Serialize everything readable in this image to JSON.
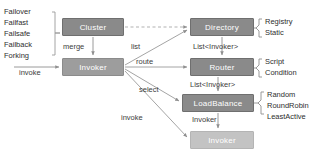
{
  "diagram": {
    "colors": {
      "node_dark": "#8a8a8a",
      "node_mid": "#9d9d9d",
      "node_light": "#c3c3c3",
      "wire": "#9a9a9a",
      "text": "#2e2e2e"
    },
    "nodes": [
      {
        "id": "cluster",
        "label": "Cluster",
        "x": 62,
        "y": 18,
        "w": 62,
        "h": 18,
        "tone": "dark"
      },
      {
        "id": "invoker_main",
        "label": "Invoker",
        "x": 62,
        "y": 58,
        "w": 62,
        "h": 18,
        "tone": "mid"
      },
      {
        "id": "directory",
        "label": "Directory",
        "x": 190,
        "y": 18,
        "w": 64,
        "h": 18,
        "tone": "dark"
      },
      {
        "id": "router",
        "label": "Router",
        "x": 190,
        "y": 58,
        "w": 64,
        "h": 18,
        "tone": "dark"
      },
      {
        "id": "loadbalance",
        "label": "LoadBalance",
        "x": 182,
        "y": 94,
        "w": 72,
        "h": 18,
        "tone": "dark"
      },
      {
        "id": "invoker_out",
        "label": "Invoker",
        "x": 190,
        "y": 131,
        "w": 64,
        "h": 18,
        "tone": "light"
      }
    ],
    "edge_labels": {
      "merge": "merge",
      "list": "list",
      "route": "route",
      "select": "select",
      "invoke_in": "invoke",
      "invoke_out": "invoke",
      "list_invoker_1": "List<Invoker>",
      "list_invoker_2": "List<Invoker>",
      "invoker_result": "Invoker"
    },
    "cluster_strategies": [
      "Failover",
      "Failfast",
      "Failsafe",
      "Failback",
      "Forking"
    ],
    "option_groups": [
      {
        "for": "directory",
        "items": [
          "Registry",
          "Static"
        ]
      },
      {
        "for": "router",
        "items": [
          "Script",
          "Condition"
        ]
      },
      {
        "for": "loadbalance",
        "items": [
          "Random",
          "RoundRobin",
          "LeastActive"
        ]
      }
    ]
  }
}
